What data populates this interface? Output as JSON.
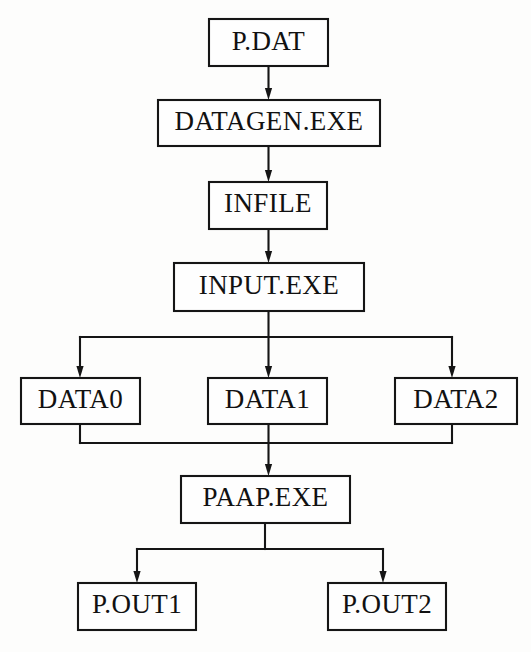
{
  "diagram": {
    "type": "flowchart",
    "background_color": "#fdfdfc",
    "line_color": "#151515",
    "box_fill_color": "#fefefe",
    "nodes": [
      {
        "id": "p_dat",
        "label": "P.DAT",
        "kind": "data-file",
        "x": 209,
        "y": 19,
        "w": 119,
        "h": 47
      },
      {
        "id": "datagen_exe",
        "label": "DATAGEN.EXE",
        "kind": "executable",
        "x": 158,
        "y": 100,
        "w": 222,
        "h": 46
      },
      {
        "id": "infile",
        "label": "INFILE",
        "kind": "data-file",
        "x": 209,
        "y": 182,
        "w": 118,
        "h": 47
      },
      {
        "id": "input_exe",
        "label": "INPUT.EXE",
        "kind": "executable",
        "x": 174,
        "y": 263,
        "w": 190,
        "h": 48
      },
      {
        "id": "data0",
        "label": "DATA0",
        "kind": "data-file",
        "x": 21,
        "y": 378,
        "w": 119,
        "h": 46
      },
      {
        "id": "data1",
        "label": "DATA1",
        "kind": "data-file",
        "x": 208,
        "y": 378,
        "w": 119,
        "h": 46
      },
      {
        "id": "data2",
        "label": "DATA2",
        "kind": "data-file",
        "x": 395,
        "y": 378,
        "w": 122,
        "h": 46
      },
      {
        "id": "paap_exe",
        "label": "PAAP.EXE",
        "kind": "executable",
        "x": 181,
        "y": 476,
        "w": 169,
        "h": 47
      },
      {
        "id": "p_out1",
        "label": "P.OUT1",
        "kind": "data-file",
        "x": 78,
        "y": 583,
        "w": 118,
        "h": 47
      },
      {
        "id": "p_out2",
        "label": "P.OUT2",
        "kind": "data-file",
        "x": 328,
        "y": 583,
        "w": 118,
        "h": 47
      }
    ],
    "edges": [
      {
        "id": "e1",
        "from": "p_dat",
        "to": "datagen_exe",
        "style": "straight-down",
        "arrow": true
      },
      {
        "id": "e2",
        "from": "datagen_exe",
        "to": "infile",
        "style": "straight-down",
        "arrow": true
      },
      {
        "id": "e3",
        "from": "infile",
        "to": "input_exe",
        "style": "straight-down",
        "arrow": true
      },
      {
        "id": "e4",
        "from": "input_exe",
        "to": "data0",
        "style": "bus-fan-out",
        "arrow": true
      },
      {
        "id": "e5",
        "from": "input_exe",
        "to": "data1",
        "style": "straight-down",
        "arrow": true
      },
      {
        "id": "e6",
        "from": "input_exe",
        "to": "data2",
        "style": "bus-fan-out",
        "arrow": true
      },
      {
        "id": "e7",
        "from": "data0",
        "to": "paap_exe",
        "style": "bus-fan-in",
        "arrow": false
      },
      {
        "id": "e8",
        "from": "data1",
        "to": "paap_exe",
        "style": "straight-down",
        "arrow": true
      },
      {
        "id": "e9",
        "from": "data2",
        "to": "paap_exe",
        "style": "bus-fan-in",
        "arrow": false
      },
      {
        "id": "e10",
        "from": "paap_exe",
        "to": "p_out1",
        "style": "bus-fan-out",
        "arrow": true
      },
      {
        "id": "e11",
        "from": "paap_exe",
        "to": "p_out2",
        "style": "bus-fan-out",
        "arrow": true
      }
    ]
  }
}
